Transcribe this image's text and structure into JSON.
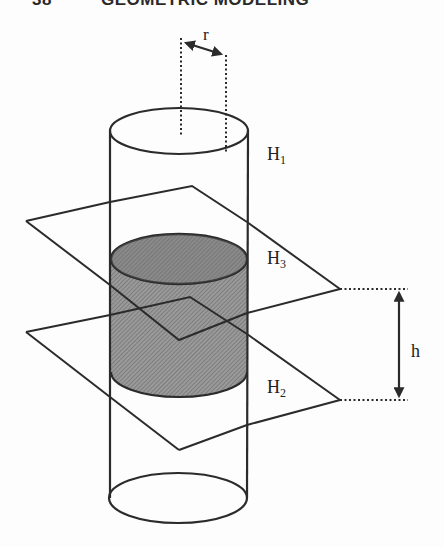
{
  "header": {
    "page_number": "38",
    "title": "GEOMETRIC MODELING"
  },
  "figure": {
    "labels": {
      "radius": "r",
      "height": "h",
      "halfspace_1": "H",
      "halfspace_1_sub": "1",
      "halfspace_2": "H",
      "halfspace_2_sub": "2",
      "halfspace_3": "H",
      "halfspace_3_sub": "3"
    },
    "colors": {
      "stroke": "#2b2b2b",
      "shaded_fill": "#8c8c8c",
      "background": "#fdfdfd"
    }
  }
}
